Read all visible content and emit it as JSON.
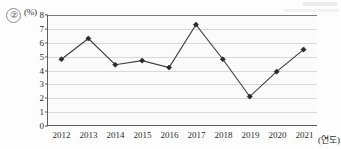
{
  "item": {
    "number": "②"
  },
  "chart_data": {
    "type": "line",
    "title": "",
    "xlabel": "(연도)",
    "ylabel": "(%)",
    "categories": [
      "2012",
      "2013",
      "2014",
      "2015",
      "2016",
      "2017",
      "2018",
      "2019",
      "2020",
      "2021"
    ],
    "values": [
      4.8,
      6.3,
      4.4,
      4.7,
      4.2,
      7.3,
      4.8,
      2.1,
      3.9,
      5.5
    ],
    "ylim": [
      0,
      8
    ],
    "yticks": [
      "0",
      "1",
      "2",
      "3",
      "4",
      "5",
      "6",
      "7",
      "8"
    ],
    "grid": true,
    "legend": "none",
    "marker": "diamond",
    "line_color": "#3b3b3b",
    "marker_color": "#2a2a2a",
    "grid_color": "#d8d8d8",
    "axis_color": "#5d5d5d"
  }
}
